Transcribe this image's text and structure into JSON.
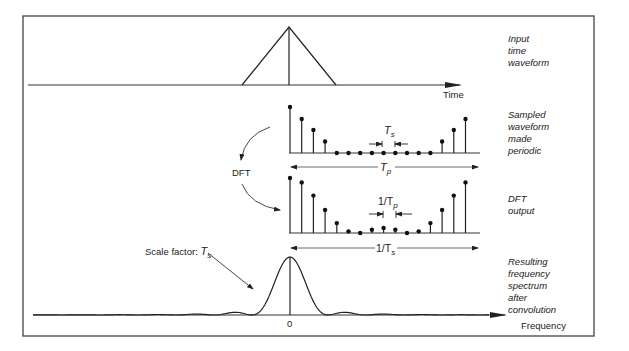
{
  "frame": {
    "stroke": "#444444"
  },
  "panels": {
    "input": {
      "side_label": [
        "Input",
        "time",
        "waveform"
      ],
      "axis_label": "Time",
      "waveform": "triangle"
    },
    "sampled": {
      "side_label": [
        "Sampled",
        "waveform",
        "made",
        "periodic"
      ],
      "sample_heights": [
        1.0,
        0.74,
        0.5,
        0.25,
        0,
        0,
        0,
        0,
        0,
        0,
        0,
        0,
        0,
        0.25,
        0.5,
        0.74
      ],
      "interval_label": {
        "main": "T",
        "sub": "s"
      },
      "period_label": {
        "main": "T",
        "sub": "p"
      }
    },
    "dft": {
      "side_label": [
        "DFT",
        "output"
      ],
      "sample_heights": [
        1.0,
        0.92,
        0.68,
        0.42,
        0.18,
        0.03,
        0.0,
        0.06,
        0.09,
        0.06,
        0.0,
        0.03,
        0.18,
        0.42,
        0.68,
        0.92
      ],
      "interval_label": {
        "main": "1/T",
        "sub": "p"
      },
      "period_label": {
        "main": "1/T",
        "sub": "s"
      },
      "transform_label": "DFT"
    },
    "spectrum": {
      "side_label": [
        "Resulting",
        "frequency",
        "spectrum",
        "after",
        "convolution"
      ],
      "axis_label": "Frequency",
      "origin_label": "0",
      "scale_label": {
        "main": "Scale factor: ",
        "var": "T",
        "sub": "s"
      }
    }
  }
}
